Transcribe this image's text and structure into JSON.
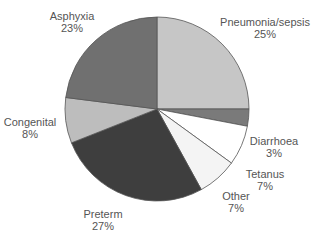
{
  "chart_data": {
    "type": "pie",
    "title": "",
    "start_angle_deg": 0,
    "direction": "clockwise",
    "center": [
      157,
      109
    ],
    "radius": 92,
    "slices": [
      {
        "label": "Pneumonia/sepsis",
        "value": 25,
        "pct_label": "25%",
        "color": "#c6c6c6",
        "label_pos": [
          265,
          16
        ]
      },
      {
        "label": "Diarrhoea",
        "value": 3,
        "pct_label": "3%",
        "color": "#7a7a7a",
        "label_pos": [
          274,
          135
        ]
      },
      {
        "label": "Tetanus",
        "value": 7,
        "pct_label": "7%",
        "color": "#ffffff",
        "label_pos": [
          265,
          168
        ]
      },
      {
        "label": "Other",
        "value": 7,
        "pct_label": "7%",
        "color": "#f4f4f4",
        "label_pos": [
          236,
          190
        ]
      },
      {
        "label": "Preterm",
        "value": 27,
        "pct_label": "27%",
        "color": "#3e3e3e",
        "label_pos": [
          103,
          208
        ]
      },
      {
        "label": "Congenital",
        "value": 8,
        "pct_label": "8%",
        "color": "#bdbdbd",
        "label_pos": [
          30,
          116
        ]
      },
      {
        "label": "Asphyxia",
        "value": 23,
        "pct_label": "23%",
        "color": "#707070",
        "label_pos": [
          72,
          10
        ]
      }
    ]
  }
}
